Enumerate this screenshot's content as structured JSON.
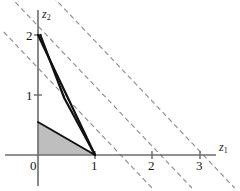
{
  "chart_data": {
    "type": "line",
    "title": "",
    "subtitle": "",
    "xlabel": "z1",
    "ylabel": "z2",
    "xlabel_display": "z",
    "xlabel_sub": "1",
    "ylabel_display": "z",
    "ylabel_sub": "2",
    "xlim": [
      -0.6,
      3.6
    ],
    "ylim": [
      -0.45,
      2.45
    ],
    "grid": false,
    "legend": null,
    "x_ticks": [
      0,
      1,
      2,
      3
    ],
    "x_tick_labels": [
      "0",
      "1",
      "2",
      "3"
    ],
    "y_ticks": [
      1,
      2
    ],
    "y_tick_labels": [
      "1",
      "2"
    ],
    "shaded_region": {
      "name": "feasible-region",
      "fill_color": "#b3b3b3",
      "opacity": 0.85,
      "vertices": [
        [
          0,
          0
        ],
        [
          1,
          0
        ],
        [
          0,
          0.55
        ]
      ]
    },
    "series": [
      {
        "name": "constraint-line-1",
        "style": "solid-bold",
        "color": "#111111",
        "width": 2.2,
        "points": [
          [
            0,
            2
          ],
          [
            1,
            0
          ]
        ]
      },
      {
        "name": "constraint-line-2",
        "style": "solid-bold",
        "color": "#111111",
        "width": 2.2,
        "points": [
          [
            0.04,
            2
          ],
          [
            0.46,
            0.95
          ],
          [
            1,
            0
          ]
        ]
      }
    ],
    "dashed_lines": [
      {
        "name": "objective-contour-1",
        "style": "dashed",
        "color": "#8a8a8a",
        "slope": -1.0,
        "x_intercept": 1.45,
        "points": [
          [
            -0.6,
            2.05
          ],
          [
            2.0,
            -0.55
          ]
        ]
      },
      {
        "name": "objective-contour-2",
        "style": "dashed",
        "color": "#8a8a8a",
        "slope": -1.0,
        "x_intercept": 2.15,
        "points": [
          [
            -0.6,
            2.75
          ],
          [
            2.7,
            -0.55
          ]
        ]
      },
      {
        "name": "objective-contour-3",
        "style": "dashed",
        "color": "#8a8a8a",
        "slope": -1.0,
        "x_intercept": 2.9,
        "points": [
          [
            -0.25,
            3.15
          ],
          [
            3.45,
            -0.55
          ]
        ]
      }
    ],
    "axes": {
      "x_axis_color": "#6b6b6b",
      "y_axis_color": "#6b6b6b",
      "x_axis_range_px": [
        5,
        216
      ],
      "y_axis_range_px": [
        10,
        186
      ]
    }
  }
}
